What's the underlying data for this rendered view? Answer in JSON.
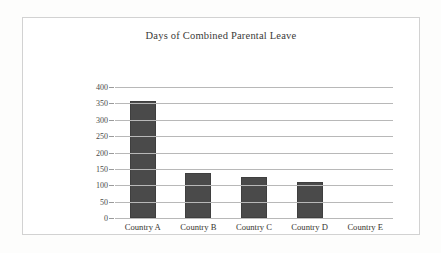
{
  "chart_data": {
    "type": "bar",
    "title": "Days of Combined Parental Leave",
    "xlabel": "",
    "ylabel": "",
    "categories": [
      "Country A",
      "Country B",
      "Country C",
      "Country D",
      "Country E"
    ],
    "values": [
      358,
      136,
      125,
      110,
      0
    ],
    "ylim": [
      0,
      400
    ],
    "ytick_step": 50,
    "yticks": [
      "400",
      "350",
      "300",
      "250",
      "200",
      "150",
      "100",
      "50",
      "0"
    ],
    "ytick_values": [
      400,
      350,
      300,
      250,
      200,
      150,
      100,
      50,
      0
    ],
    "grid": true,
    "legend": false,
    "series": [
      {
        "name": "Days of Combined Parental Leave",
        "values": [
          358,
          136,
          125,
          110,
          0
        ]
      }
    ]
  },
  "style": {
    "bar_color": "#4a4a4a",
    "bar_border_color": "#3f3f3f",
    "gridline_color": "#b8b8b8",
    "frame_border_color": "#d2d2d2",
    "background": "#ffffff",
    "page_background": "#fdfdfc",
    "title_color": "#3a3a38",
    "tick_label_color": "#4a4a48",
    "category_label_color": "#37352f"
  }
}
